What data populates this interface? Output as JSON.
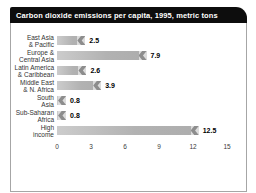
{
  "title": "Carbon dioxide emissions per capita, 1995, metric tons",
  "colors": {
    "title_bg": "#0d0d0d",
    "title_text": "#ffffff",
    "bar_body": "#b2b2b2",
    "bar_body_light": "#cccccc",
    "bar_tip_dark": "#8d8d8d",
    "bar_tip_light": "#dcdcdc",
    "card_border": "#a6a6a6",
    "background": "#ffffff"
  },
  "chart_data": {
    "type": "bar",
    "orientation": "horizontal",
    "title": "Carbon dioxide emissions per capita, 1995, metric tons",
    "categories": [
      "East Asia & Pacific",
      "Europe & Central Asia",
      "Latin America & Caribbean",
      "Middle East & N. Africa",
      "South Asia",
      "Sub-Saharan Africa",
      "High income"
    ],
    "label_lines": [
      [
        "East Asia",
        "& Pacific"
      ],
      [
        "Europe &",
        "Central Asia"
      ],
      [
        "Latin America",
        "& Caribbean"
      ],
      [
        "Middle East",
        "& N. Africa"
      ],
      [
        "South",
        "Asia"
      ],
      [
        "Sub-Saharan",
        "Africa"
      ],
      [
        "High",
        "income"
      ]
    ],
    "values": [
      2.5,
      7.9,
      2.6,
      3.9,
      0.8,
      0.8,
      12.5
    ],
    "value_labels": [
      "2.5",
      "7.9",
      "2.6",
      "3.9",
      "0.8",
      "0.8",
      "12.5"
    ],
    "xticks": [
      "0",
      "3",
      "6",
      "9",
      "12",
      "15"
    ],
    "xlim": [
      0,
      15
    ],
    "grid": false,
    "legend": null
  }
}
